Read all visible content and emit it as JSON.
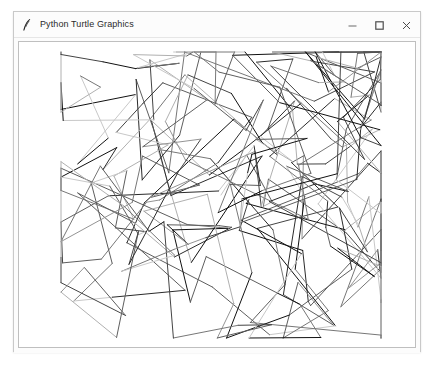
{
  "window": {
    "title": "Python Turtle Graphics",
    "icon": "python-turtle-feather-icon",
    "controls": [
      {
        "name": "minimize-button",
        "glyph": "minimize-icon",
        "label": "—"
      },
      {
        "name": "maximize-button",
        "glyph": "maximize-icon",
        "label": "☐"
      },
      {
        "name": "close-button",
        "glyph": "close-icon",
        "label": "×"
      }
    ],
    "background": "#fcfcfc",
    "border_color": "#c9c9c9"
  },
  "canvas": {
    "background": "#ffffff",
    "border_color": "#bfbfbf",
    "description": "Random straight-line turtle drawing: many overlapping segments in varying grayscale shades",
    "drawing_bounds": {
      "x_min": 42,
      "x_max": 362,
      "y_min": 10,
      "y_max": 296
    },
    "stroke_palette": [
      "#111111",
      "#2b2b2b",
      "#444444",
      "#5e5e5e",
      "#777777",
      "#949494",
      "#b0b0b0",
      "#c8c8c8"
    ],
    "stroke_width": 1,
    "segment_count": 300,
    "seed": 20240517
  }
}
